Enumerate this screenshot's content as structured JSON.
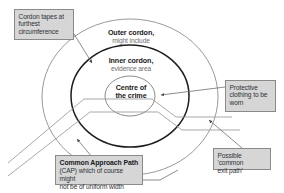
{
  "diagram": {
    "background_color": "#ffffff",
    "stroke_color": "#8a8a8a",
    "emphasis_stroke_color": "#1a1a1a",
    "callout_fill_color": "#d6d6d6",
    "callout_border_color": "#8a8a8a",
    "text_color": "#1a1a1a",
    "secondary_text_color": "#6e6e6e"
  },
  "rings": {
    "outer": {
      "line1": "Outer cordon,",
      "line2": "might include"
    },
    "inner": {
      "line1": "Inner cordon,",
      "line2": "evidence area"
    },
    "centre": {
      "line1": "Centre of",
      "line2": "the crime"
    }
  },
  "callouts": {
    "cordon_tapes": {
      "line1": "Cordon tapes at",
      "line2": "furthest",
      "line3": "circumference"
    },
    "protective_clothing": {
      "line1": "Protective",
      "line2": "clothing to be",
      "line3": "worn"
    },
    "exit_path": {
      "line1": "Possible 'common",
      "line2": "exit path'"
    },
    "common_approach_path": {
      "title": "Common Approach Path",
      "line1": "(CAP) which of course might",
      "line2": "not be of uniform width"
    }
  }
}
